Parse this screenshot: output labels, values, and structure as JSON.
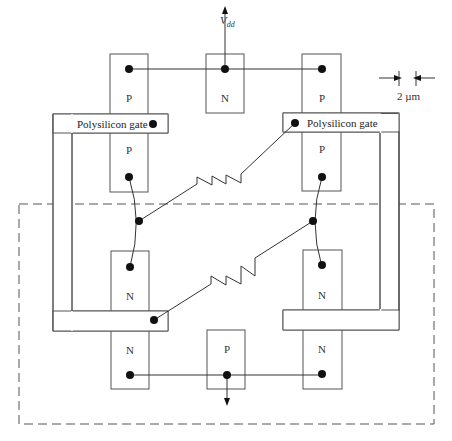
{
  "diagram": {
    "supply_label": "V",
    "supply_subscript": "dd",
    "scale_bar_label": "2 µm",
    "poly_gate_left_label": "Polysilicon gate",
    "poly_gate_right_label": "Polysilicon gate",
    "regions": {
      "top_left_upper": "P",
      "top_center": "N",
      "top_right_upper": "P",
      "top_left_lower": "P",
      "top_right_lower": "P",
      "bottom_left_upper": "N",
      "bottom_right_upper": "N",
      "bottom_left_lower": "N",
      "bottom_center": "P",
      "bottom_right_lower": "N"
    },
    "colors": {
      "stroke": "#555555",
      "wire": "#333333",
      "dot": "#111111",
      "background": "#ffffff"
    }
  }
}
